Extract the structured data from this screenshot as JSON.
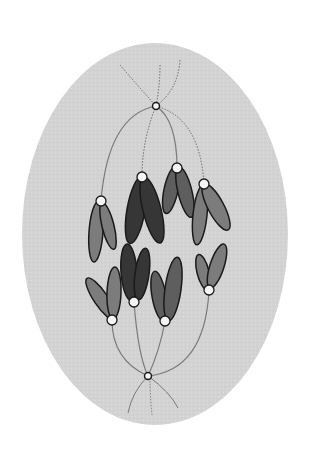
{
  "diagram": {
    "cell": {
      "cx": 155,
      "cy": 234,
      "rx": 133,
      "ry": 191,
      "fill": "#d4d4d4"
    },
    "poles": [
      {
        "name": "top-pole",
        "x": 156,
        "y": 106
      },
      {
        "name": "bottom-pole",
        "x": 148,
        "y": 376
      }
    ],
    "colors": {
      "background": "#ffffff",
      "cell": "#d4d4d4",
      "spindle": "#7a7a7a",
      "outline": "#1a1a1a",
      "centromere": "#f4f4f4",
      "dark": "#363636",
      "medium": "#5e5e5e",
      "light": "#7c7c7c"
    },
    "upper_chromosomes": [
      {
        "x": 101,
        "y": 201,
        "tone": "light"
      },
      {
        "x": 142,
        "y": 177,
        "tone": "dark"
      },
      {
        "x": 177,
        "y": 168,
        "tone": "medium"
      },
      {
        "x": 204,
        "y": 184,
        "tone": "light"
      }
    ],
    "lower_chromosomes": [
      {
        "x": 112,
        "y": 320,
        "tone": "light"
      },
      {
        "x": 134,
        "y": 302,
        "tone": "dark"
      },
      {
        "x": 165,
        "y": 321,
        "tone": "medium"
      },
      {
        "x": 209,
        "y": 290,
        "tone": "light"
      }
    ]
  }
}
